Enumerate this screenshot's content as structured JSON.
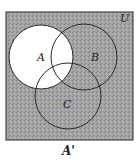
{
  "diagram": {
    "type": "venn",
    "universal_label": "U",
    "sets": [
      {
        "id": "A",
        "label": "A",
        "cx": 41,
        "cy": 57,
        "r": 32
      },
      {
        "id": "B",
        "label": "B",
        "cx": 84,
        "cy": 57,
        "r": 33
      },
      {
        "id": "C",
        "label": "C",
        "cx": 68,
        "cy": 96,
        "r": 33
      }
    ],
    "shaded_region": "A'",
    "caption": "A'",
    "colors": {
      "shade": "#9a9a9a",
      "unshaded": "#ffffff",
      "stroke": "#2a2a2a"
    }
  }
}
